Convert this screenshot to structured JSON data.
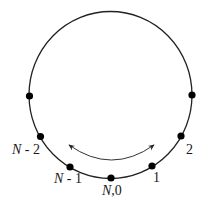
{
  "diagram": {
    "type": "ring-lattice",
    "circle": {
      "cx": 110.5,
      "cy": 95,
      "rx": 81.5,
      "ry": 83.5,
      "stroke": "#222222"
    },
    "nodes": [
      {
        "id": "left-unlabeled",
        "x": 29.5,
        "y": 96,
        "label": ""
      },
      {
        "id": "right-unlabeled",
        "x": 192,
        "y": 95,
        "label": ""
      },
      {
        "id": "n-minus-2",
        "x": 40.5,
        "y": 136.5,
        "label_var": "N",
        "label_rest": " - 2",
        "lx": 12,
        "ly": 154
      },
      {
        "id": "n-minus-1",
        "x": 70,
        "y": 167,
        "label_var": "N",
        "label_rest": " - 1",
        "lx": 54,
        "ly": 183
      },
      {
        "id": "n-zero",
        "x": 111,
        "y": 178,
        "label_var": "N",
        "label_rest": ",0",
        "lx": 102,
        "ly": 195
      },
      {
        "id": "one",
        "x": 152,
        "y": 166,
        "label_var": "",
        "label_rest": "1",
        "lx": 153,
        "ly": 182
      },
      {
        "id": "two",
        "x": 181,
        "y": 136,
        "label_var": "",
        "label_rest": "2",
        "lx": 186,
        "ly": 154
      }
    ],
    "arrow": {
      "from": [
        69,
        145
      ],
      "to": [
        154,
        145
      ],
      "control": [
        111.5,
        175
      ],
      "bidirectional": true
    },
    "colors": {
      "line": "#222222",
      "dot": "#000000",
      "text": "#1a1a1a"
    }
  }
}
